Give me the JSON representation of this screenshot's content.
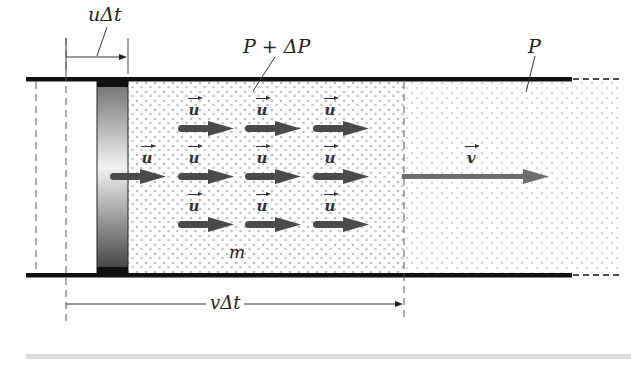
{
  "diagram": {
    "labels": {
      "u_dt": "uΔt",
      "v_dt": "vΔt",
      "p_plus_dp": "P + ΔP",
      "p": "P",
      "mass": "m",
      "piston_velocity": "u",
      "wave_velocity": "v"
    },
    "velocity_vectors": [
      {
        "row": 1,
        "label": "u",
        "count": 3
      },
      {
        "row": 2,
        "label": "u",
        "count": 4
      },
      {
        "row": 3,
        "label": "u",
        "count": 3
      }
    ],
    "colors": {
      "wall": "#111111",
      "arrow": "#4a4a4a",
      "v_arrow": "#6e6e6e",
      "dots_dense": "#bdbdbd",
      "dots_light": "#cfcfcf",
      "bottom_bar": "#dcdcdc"
    }
  }
}
